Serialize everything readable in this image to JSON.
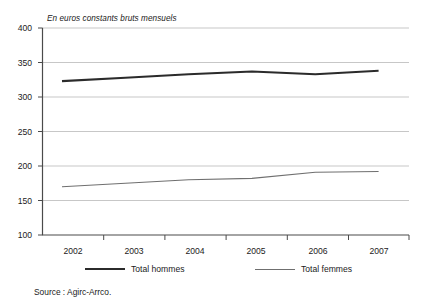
{
  "chart_data": {
    "type": "line",
    "title": "En euros constants bruts mensuels",
    "xlabel": "",
    "ylabel": "",
    "categories": [
      "2002",
      "2003",
      "2004",
      "2005",
      "2006",
      "2007"
    ],
    "x": [
      2002,
      2003,
      2004,
      2005,
      2006,
      2007
    ],
    "ylim": [
      100,
      400
    ],
    "yticks": [
      100,
      150,
      200,
      250,
      300,
      350,
      400
    ],
    "ytick_labels": [
      "100",
      "150",
      "200",
      "250",
      "300",
      "350",
      "400"
    ],
    "grid": true,
    "legend_position": "bottom",
    "series": [
      {
        "name": "Total hommes",
        "values": [
          323,
          328,
          333,
          337,
          333,
          338
        ],
        "style": "thick",
        "color": "#2b2b2b"
      },
      {
        "name": "Total femmes",
        "values": [
          170,
          175,
          180,
          182,
          191,
          192
        ],
        "style": "thin",
        "color": "#6f6f6f"
      }
    ],
    "source": "Source : Agirc-Arrco."
  },
  "legend": {
    "entries": [
      {
        "label": "Total hommes"
      },
      {
        "label": "Total femmes"
      }
    ]
  },
  "axes": {
    "y_labels": [
      "400",
      "350",
      "300",
      "250",
      "200",
      "150",
      "100"
    ],
    "x_labels": [
      "2002",
      "2003",
      "2004",
      "2005",
      "2006",
      "2007"
    ]
  },
  "footer": {
    "source": "Source : Agirc-Arrco."
  },
  "colors": {
    "hommes_line": "#2b2b2b",
    "femmes_line": "#6f6f6f",
    "grid": "#b9b9b9",
    "axis": "#4a4a4a",
    "text": "#1b1b1b"
  }
}
